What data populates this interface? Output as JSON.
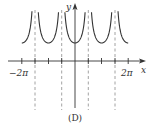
{
  "figure": {
    "caption": "(D)",
    "x_axis_label": "x",
    "y_axis_label": "y",
    "tick_labels": [
      {
        "text": "−2π",
        "value": -6.2832
      },
      {
        "text": "2π",
        "value": 6.2832
      }
    ]
  },
  "chart_data": {
    "type": "line",
    "title": "(D)",
    "xlabel": "x",
    "ylabel": "y",
    "function": "|sec x| (positive branches only)",
    "xlim": [
      -6.2832,
      6.2832
    ],
    "ylim": [
      0,
      2.8
    ],
    "x_ticks": [
      "-2π",
      "-3π/2",
      "-π",
      "-π/2",
      "π/2",
      "π",
      "3π/2",
      "2π"
    ],
    "labeled_ticks": [
      "-2π",
      "2π"
    ],
    "vertical_asymptotes": [
      "-3π/2",
      "-π/2",
      "π/2",
      "3π/2"
    ],
    "local_minima": [
      {
        "x": "-2π",
        "y": 1
      },
      {
        "x": "-π",
        "y": 1
      },
      {
        "x": "0",
        "y": 1
      },
      {
        "x": "π",
        "y": 1
      },
      {
        "x": "2π",
        "y": 1
      }
    ],
    "grid": false,
    "legend": null
  },
  "colors": {
    "curve": "#333333",
    "axis": "#333333",
    "asymptote": "#888888",
    "background": "#ffffff"
  }
}
